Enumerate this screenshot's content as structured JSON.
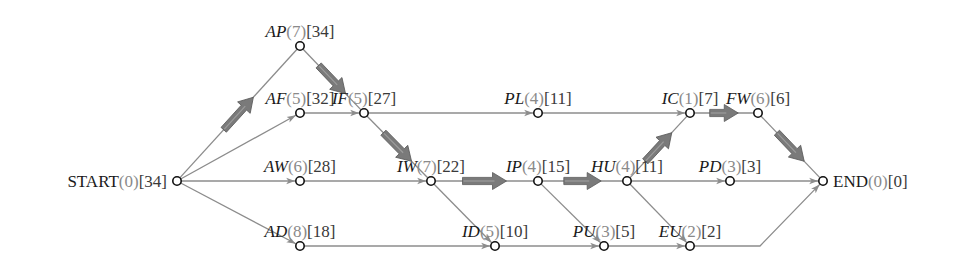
{
  "diagram": {
    "type": "activity-on-node network (critical path)",
    "label_format": "NAME(duration)[remaining]",
    "colors": {
      "edge": "#8c8c8c",
      "critical_arrow": "#7a7a7a",
      "node_stroke": "#111111",
      "duration_text": "#8a8a8a",
      "name_text": "#1a1a1a"
    },
    "nodes": [
      {
        "id": "START",
        "name": "START",
        "duration": "(0)",
        "value": "[34]",
        "x": 177,
        "y": 181,
        "italic": false,
        "label_side": "left"
      },
      {
        "id": "AP",
        "name": "AP",
        "duration": "(7)",
        "value": "[34]",
        "x": 300,
        "y": 46,
        "italic": true,
        "label_side": "above"
      },
      {
        "id": "AF",
        "name": "AF",
        "duration": "(5)",
        "value": "[32]",
        "x": 300,
        "y": 113,
        "italic": true,
        "label_side": "above"
      },
      {
        "id": "AW",
        "name": "AW",
        "duration": "(6)",
        "value": "[28]",
        "x": 300,
        "y": 181,
        "italic": true,
        "label_side": "above"
      },
      {
        "id": "AD",
        "name": "AD",
        "duration": "(8)",
        "value": "[18]",
        "x": 300,
        "y": 246,
        "italic": true,
        "label_side": "above"
      },
      {
        "id": "IF",
        "name": "IF",
        "duration": "(5)",
        "value": "[27]",
        "x": 364,
        "y": 113,
        "italic": true,
        "label_side": "above"
      },
      {
        "id": "IW",
        "name": "IW",
        "duration": "(7)",
        "value": "[22]",
        "x": 431,
        "y": 181,
        "italic": true,
        "label_side": "above"
      },
      {
        "id": "PL",
        "name": "PL",
        "duration": "(4)",
        "value": "[11]",
        "x": 538,
        "y": 113,
        "italic": true,
        "label_side": "above"
      },
      {
        "id": "IP",
        "name": "IP",
        "duration": "(4)",
        "value": "[15]",
        "x": 538,
        "y": 181,
        "italic": true,
        "label_side": "above"
      },
      {
        "id": "ID",
        "name": "ID",
        "duration": "(5)",
        "value": "[10]",
        "x": 495,
        "y": 246,
        "italic": true,
        "label_side": "above"
      },
      {
        "id": "IC",
        "name": "IC",
        "duration": "(1)",
        "value": "[7]",
        "x": 690,
        "y": 113,
        "italic": true,
        "label_side": "above"
      },
      {
        "id": "FW",
        "name": "FW",
        "duration": "(6)",
        "value": "[6]",
        "x": 758,
        "y": 113,
        "italic": true,
        "label_side": "above"
      },
      {
        "id": "HU",
        "name": "HU",
        "duration": "(4)",
        "value": "[11]",
        "x": 627,
        "y": 181,
        "italic": true,
        "label_side": "above"
      },
      {
        "id": "PD",
        "name": "PD",
        "duration": "(3)",
        "value": "[3]",
        "x": 730,
        "y": 181,
        "italic": true,
        "label_side": "above"
      },
      {
        "id": "PU",
        "name": "PU",
        "duration": "(3)",
        "value": "[5]",
        "x": 604,
        "y": 246,
        "italic": true,
        "label_side": "above"
      },
      {
        "id": "EU",
        "name": "EU",
        "duration": "(2)",
        "value": "[2]",
        "x": 690,
        "y": 246,
        "italic": true,
        "label_side": "above"
      },
      {
        "id": "END",
        "name": "END",
        "duration": "(0)",
        "value": "[0]",
        "x": 823,
        "y": 181,
        "italic": false,
        "label_side": "right"
      }
    ],
    "edges": [
      {
        "from": "START",
        "to": "AP",
        "critical": true
      },
      {
        "from": "START",
        "to": "AF",
        "critical": false
      },
      {
        "from": "START",
        "to": "AW",
        "critical": false
      },
      {
        "from": "START",
        "to": "AD",
        "critical": false
      },
      {
        "from": "AP",
        "to": "IF",
        "critical": true
      },
      {
        "from": "AF",
        "to": "IF",
        "critical": false
      },
      {
        "from": "IF",
        "to": "PL",
        "critical": false
      },
      {
        "from": "IF",
        "to": "IW",
        "critical": true
      },
      {
        "from": "AW",
        "to": "IW",
        "critical": false
      },
      {
        "from": "PL",
        "to": "IC",
        "critical": false
      },
      {
        "from": "IW",
        "to": "IP",
        "critical": true
      },
      {
        "from": "IW",
        "to": "ID",
        "critical": false
      },
      {
        "from": "AD",
        "to": "ID",
        "critical": false
      },
      {
        "from": "IP",
        "to": "HU",
        "critical": true
      },
      {
        "from": "IP",
        "to": "PU",
        "critical": false
      },
      {
        "from": "ID",
        "to": "PU",
        "critical": false
      },
      {
        "from": "HU",
        "to": "IC",
        "critical": true
      },
      {
        "from": "HU",
        "to": "PD",
        "critical": false
      },
      {
        "from": "HU",
        "to": "EU",
        "critical": false
      },
      {
        "from": "PU",
        "to": "EU",
        "critical": false
      },
      {
        "from": "IC",
        "to": "FW",
        "critical": true
      },
      {
        "from": "FW",
        "to": "END",
        "critical": true
      },
      {
        "from": "PD",
        "to": "END",
        "critical": false
      },
      {
        "from": "EU",
        "to": "END",
        "critical": false
      }
    ],
    "critical_path": [
      "START",
      "AP",
      "IF",
      "IW",
      "IP",
      "HU",
      "IC",
      "FW",
      "END"
    ]
  }
}
